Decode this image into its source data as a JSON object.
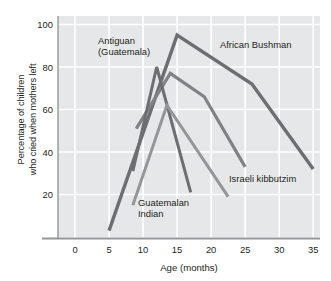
{
  "chart_data": {
    "type": "line",
    "title": "",
    "xlabel": "Age (months)",
    "ylabel": "Percentage of children who cried when mothers left",
    "ylabel_line1": "Percentage of children",
    "ylabel_line2": "who cried when mothers left",
    "xlim": [
      -2.5,
      36
    ],
    "ylim": [
      0,
      104
    ],
    "xticks": [
      0,
      5,
      10,
      15,
      20,
      25,
      30,
      35
    ],
    "xtick_labels": [
      "0",
      "5",
      "10",
      "15",
      "20",
      "25",
      "30",
      "35"
    ],
    "yticks": [
      20,
      40,
      60,
      80,
      100
    ],
    "ytick_labels": [
      "20",
      "40",
      "60",
      "80",
      "100"
    ],
    "grid": true,
    "grid_color": "#ffffff",
    "plot_background": "#e6e7e8",
    "legend_position": "inline-annotations",
    "series": [
      {
        "name": "African Bushman",
        "color": "#6d6e71",
        "width": 3.4,
        "x": [
          5,
          15,
          26,
          35
        ],
        "y": [
          3,
          95,
          72,
          32
        ]
      },
      {
        "name": "Antiguan (Guatemala)",
        "color": "#808285",
        "width": 3.2,
        "x": [
          9,
          14,
          19,
          25
        ],
        "y": [
          51,
          77,
          66,
          33
        ]
      },
      {
        "name": "Guatemalan Indian",
        "color": "#6d6e71",
        "width": 3.0,
        "x": [
          8.5,
          12,
          17
        ],
        "y": [
          31,
          80,
          21
        ]
      },
      {
        "name": "Israeli kibbutzim",
        "color": "#939598",
        "width": 3.0,
        "x": [
          8.5,
          13.5,
          22.5
        ],
        "y": [
          15,
          62,
          19
        ]
      }
    ],
    "annotations": [
      {
        "name": "Antiguan (Guatemala)",
        "line1": "Antiguan",
        "line2": "(Guatemala)",
        "x_px": 98,
        "y_px": 44
      },
      {
        "name": "African Bushman",
        "line1": "African Bushman",
        "line2": "",
        "x_px": 220,
        "y_px": 48
      },
      {
        "name": "Israeli kibbutzim",
        "line1": "Israeli kibbutzim",
        "line2": "",
        "x_px": 229,
        "y_px": 182
      },
      {
        "name": "Guatemalan Indian",
        "line1": "Guatemalan",
        "line2": "Indian",
        "x_px": 138,
        "y_px": 206
      }
    ]
  }
}
